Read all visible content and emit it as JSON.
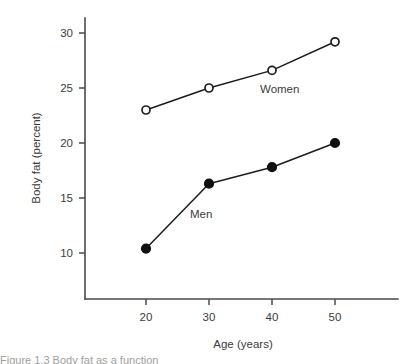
{
  "chart_data": {
    "type": "line",
    "title": "",
    "xlabel": "Age (years)",
    "ylabel": "Body fat (percent)",
    "x": [
      20,
      30,
      40,
      50
    ],
    "xtick_labels": [
      "20",
      "30",
      "40",
      "50"
    ],
    "ytick_labels": [
      "10",
      "15",
      "20",
      "25",
      "30"
    ],
    "yticks": [
      10,
      15,
      20,
      25,
      30
    ],
    "xlim": [
      14,
      56
    ],
    "ylim": [
      6.5,
      31.5
    ],
    "grid": false,
    "legend": "inline-annotations",
    "series": [
      {
        "name": "Women",
        "marker": "open-circle",
        "values": [
          23.0,
          25.0,
          26.6,
          29.2
        ],
        "label_text": "Women"
      },
      {
        "name": "Men",
        "marker": "filled-circle",
        "values": [
          10.4,
          16.3,
          17.8,
          20.0
        ],
        "label_text": "Men"
      }
    ],
    "annotations": [
      {
        "text": "Women",
        "x": 41.5,
        "y": 24.6
      },
      {
        "text": "Men",
        "x": 31.0,
        "y": 13.2
      }
    ]
  },
  "figure": {
    "caption_partial": "Figure 1.3  Body fat as a function"
  }
}
